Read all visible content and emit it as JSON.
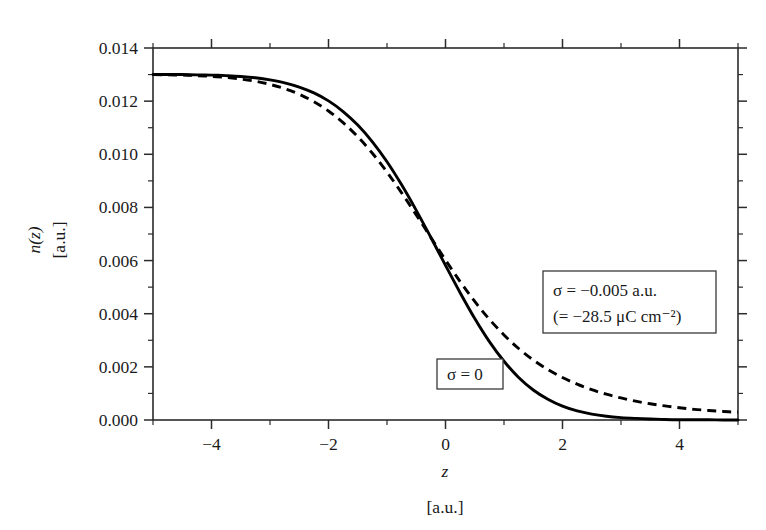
{
  "figure": {
    "background_color": "#ffffff",
    "frame_color": "#2b2b2b",
    "curve_color": "#000000"
  },
  "chart_data": {
    "type": "line",
    "title": "",
    "subtitle": "",
    "xlabel": "z",
    "xlabel_units": "[a.u.]",
    "ylabel": "n(z)",
    "ylabel_units": "[a.u.]",
    "xlim": [
      -5,
      5
    ],
    "ylim": [
      0.0,
      0.014
    ],
    "grid": false,
    "legend_position": "inside-annotations",
    "x_ticks_major": [
      -4,
      -2,
      0,
      2,
      4
    ],
    "x_tick_labels": [
      "−4",
      "−2",
      "0",
      "2",
      "4"
    ],
    "x_ticks_minor": [
      -5,
      -3,
      -1,
      1,
      3,
      5
    ],
    "y_ticks_major": [
      0.0,
      0.002,
      0.004,
      0.006,
      0.008,
      0.01,
      0.012,
      0.014
    ],
    "y_tick_labels": [
      "0.000",
      "0.002",
      "0.004",
      "0.006",
      "0.008",
      "0.010",
      "0.012",
      "0.014"
    ],
    "y_ticks_minor": [
      0.001,
      0.003,
      0.005,
      0.007,
      0.009,
      0.011,
      0.013
    ],
    "annotations": [
      {
        "id": "sigma-charged",
        "line1": "σ = −0.005 a.u.",
        "line2": "(= −28.5 μC cm⁻²)",
        "box_x": 543,
        "box_y": 271,
        "box_w": 173,
        "box_h": 62
      },
      {
        "id": "sigma-zero",
        "line1": "σ = 0",
        "line2": "",
        "box_x": 437,
        "box_y": 359,
        "box_w": 66,
        "box_h": 30
      }
    ],
    "series": [
      {
        "name": "sigma = 0",
        "style": "solid",
        "label_ref": "sigma-zero",
        "x": [
          -5.0,
          -4.75,
          -4.5,
          -4.25,
          -4.0,
          -3.75,
          -3.5,
          -3.25,
          -3.0,
          -2.75,
          -2.5,
          -2.25,
          -2.0,
          -1.75,
          -1.5,
          -1.25,
          -1.0,
          -0.75,
          -0.5,
          -0.25,
          0.0,
          0.25,
          0.5,
          0.75,
          1.0,
          1.25,
          1.5,
          1.75,
          2.0,
          2.25,
          2.5,
          2.75,
          3.0,
          3.25,
          3.5,
          3.75,
          4.0,
          4.25,
          4.5,
          4.75,
          5.0
        ],
        "values": [
          0.013,
          0.013,
          0.013,
          0.01299,
          0.01298,
          0.01296,
          0.01293,
          0.01288,
          0.0128,
          0.01269,
          0.01253,
          0.01231,
          0.01201,
          0.01161,
          0.0111,
          0.01047,
          0.00972,
          0.00885,
          0.00789,
          0.00687,
          0.00582,
          0.00479,
          0.00382,
          0.00295,
          0.00221,
          0.0016,
          0.00113,
          0.00078,
          0.00052,
          0.00034,
          0.00022,
          0.00014,
          9e-05,
          6e-05,
          4e-05,
          2e-05,
          1e-05,
          1e-05,
          1e-05,
          0.0,
          0.0
        ]
      },
      {
        "name": "sigma = -0.005 a.u.",
        "style": "dashed",
        "label_ref": "sigma-charged",
        "x": [
          -5.0,
          -4.75,
          -4.5,
          -4.25,
          -4.0,
          -3.75,
          -3.5,
          -3.25,
          -3.0,
          -2.75,
          -2.5,
          -2.25,
          -2.0,
          -1.75,
          -1.5,
          -1.25,
          -1.0,
          -0.75,
          -0.5,
          -0.25,
          0.0,
          0.25,
          0.5,
          0.75,
          1.0,
          1.25,
          1.5,
          1.75,
          2.0,
          2.25,
          2.5,
          2.75,
          3.0,
          3.25,
          3.5,
          3.75,
          4.0,
          4.25,
          4.5,
          4.75,
          5.0
        ],
        "values": [
          0.013,
          0.01299,
          0.01298,
          0.01296,
          0.01293,
          0.01289,
          0.01283,
          0.01275,
          0.01263,
          0.01247,
          0.01226,
          0.01198,
          0.01163,
          0.01119,
          0.01066,
          0.01004,
          0.00933,
          0.00855,
          0.00772,
          0.00687,
          0.00602,
          0.00521,
          0.00446,
          0.00379,
          0.0032,
          0.00269,
          0.00226,
          0.0019,
          0.0016,
          0.00135,
          0.00114,
          0.00097,
          0.00083,
          0.00071,
          0.00061,
          0.00053,
          0.00046,
          0.0004,
          0.00036,
          0.00032,
          0.00029
        ]
      }
    ],
    "crossing_point": {
      "x": -0.25,
      "y": 0.00687
    }
  }
}
